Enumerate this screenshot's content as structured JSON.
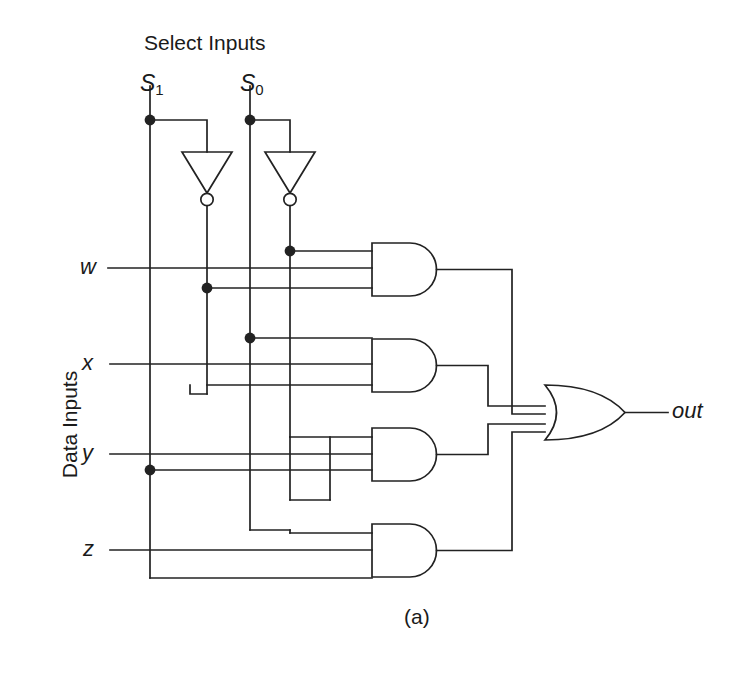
{
  "figure": {
    "caption": "(a)",
    "title_select": "Select Inputs",
    "title_data": "Data Inputs",
    "output_label": "out",
    "line_color": "#222222",
    "background_color": "#ffffff"
  },
  "select_inputs": [
    {
      "name": "S1",
      "base": "S",
      "sub": "1"
    },
    {
      "name": "S0",
      "base": "S",
      "sub": "0"
    }
  ],
  "data_inputs": [
    {
      "name": "w"
    },
    {
      "name": "x"
    },
    {
      "name": "y"
    },
    {
      "name": "z"
    }
  ],
  "gates": {
    "inverters": [
      {
        "id": "inv-s1"
      },
      {
        "id": "inv-s0"
      }
    ],
    "and_gates": [
      {
        "id": "and-1",
        "inputs": 3
      },
      {
        "id": "and-2",
        "inputs": 3
      },
      {
        "id": "and-3",
        "inputs": 3
      },
      {
        "id": "and-4",
        "inputs": 3
      }
    ],
    "or_gate": {
      "id": "or-1",
      "inputs": 4
    }
  }
}
